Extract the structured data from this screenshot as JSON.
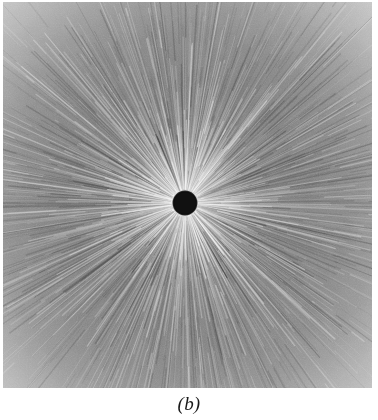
{
  "figure": {
    "caption": "(b)",
    "panel_label": "b",
    "type": "grayscale-radial-streak-micrograph",
    "background_color": "#ffffff"
  },
  "image_panel": {
    "name": "radial streak pattern",
    "alt_text": "Dense radial streaks emanating outward from a small solid black disc at the centre of a square grayscale field",
    "geometry": {
      "left": 3,
      "top": 2,
      "width": 369,
      "height": 386
    },
    "center": {
      "x": 185,
      "y": 203
    },
    "center_disc_radius": 11.5,
    "colors": {
      "center_disc": "#111111",
      "field_mid": "#8a8a8a",
      "field_inner_bright": "#c8c8c8",
      "field_dark_ring": "#6e6e6e",
      "corner_light": "#d4d4d4",
      "streak_light": "#e2e2e2",
      "streak_dark": "#4a4a4a"
    }
  },
  "chart_data": {
    "type": "heatmap",
    "title": "",
    "subtitle": "",
    "xlabel": "",
    "ylabel": "",
    "annotations": [
      "(b)"
    ],
    "legend": [],
    "grid": false,
    "center_fraction": {
      "x": 0.493,
      "y": 0.521
    },
    "radial_profile": {
      "r_fraction": [
        0.0,
        0.03,
        0.06,
        0.1,
        0.18,
        0.28,
        0.4,
        0.55,
        0.7,
        0.85,
        1.0
      ],
      "gray_level": [
        17,
        17,
        200,
        178,
        150,
        132,
        126,
        134,
        150,
        178,
        212
      ]
    },
    "streak_count": 420,
    "streak_angular_range_deg": [
      0,
      360
    ]
  }
}
